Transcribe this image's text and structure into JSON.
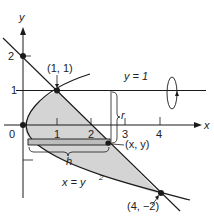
{
  "figure": {
    "axes": {
      "x_label": "x",
      "y_label": "y",
      "origin_label": "0",
      "x_ticks": [
        "1",
        "2",
        "3",
        "4"
      ],
      "y_ticks": [
        "1",
        "2"
      ]
    },
    "curves": {
      "parabola_label": "x = y",
      "parabola_exponent": "2",
      "line_y1_label": "y = 1"
    },
    "points": {
      "p1": "(1, 1)",
      "p2": "(4, −2)",
      "p3": "(x, y)"
    },
    "annotations": {
      "radius_label": "r",
      "height_label": "h"
    },
    "colors": {
      "region_fill": "#d4d4d4",
      "ink": "#1a1a1a"
    }
  }
}
